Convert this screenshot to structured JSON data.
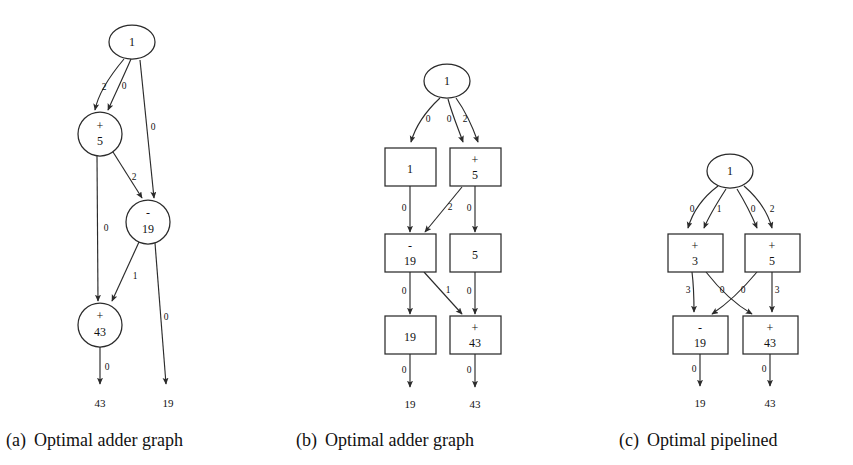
{
  "figure": {
    "background_color": "#ffffff",
    "stroke_color": "#2b2b2b",
    "text_color": "#111111"
  },
  "panels": [
    {
      "id": "a",
      "caption_tag": "(a)",
      "caption_text": "Optimal adder graph",
      "node_shape": "circle",
      "nodes": [
        {
          "key": "input",
          "op": "",
          "value": "1",
          "shape": "ellipse"
        },
        {
          "key": "add5",
          "op": "+",
          "value": "5",
          "shape": "circle"
        },
        {
          "key": "sub19",
          "op": "-",
          "value": "19",
          "shape": "circle"
        },
        {
          "key": "add43",
          "op": "+",
          "value": "43",
          "shape": "circle"
        }
      ],
      "edges": [
        {
          "from": "input",
          "to": "add5",
          "label": "2"
        },
        {
          "from": "input",
          "to": "add5",
          "label": "0"
        },
        {
          "from": "input",
          "to": "sub19",
          "label": "0"
        },
        {
          "from": "add5",
          "to": "add43",
          "label": "0"
        },
        {
          "from": "add5",
          "to": "sub19",
          "label": "2"
        },
        {
          "from": "sub19",
          "to": "add43",
          "label": "1"
        },
        {
          "from": "sub19",
          "to": "out19",
          "label": "0"
        },
        {
          "from": "add43",
          "to": "out43",
          "label": "0"
        }
      ],
      "terminals": [
        {
          "key": "out43",
          "value": "43"
        },
        {
          "key": "out19",
          "value": "19"
        }
      ]
    },
    {
      "id": "b",
      "caption_tag": "(b)",
      "caption_text": "Optimal adder graph",
      "node_shape": "rect",
      "nodes": [
        {
          "key": "input",
          "op": "",
          "value": "1",
          "shape": "ellipse"
        },
        {
          "key": "reg1",
          "op": "",
          "value": "1",
          "shape": "rect"
        },
        {
          "key": "add5",
          "op": "+",
          "value": "5",
          "shape": "rect"
        },
        {
          "key": "sub19",
          "op": "-",
          "value": "19",
          "shape": "rect"
        },
        {
          "key": "reg5",
          "op": "",
          "value": "5",
          "shape": "rect"
        },
        {
          "key": "reg19",
          "op": "",
          "value": "19",
          "shape": "rect"
        },
        {
          "key": "add43",
          "op": "+",
          "value": "43",
          "shape": "rect"
        }
      ],
      "edges": [
        {
          "from": "input",
          "to": "reg1",
          "label": "0"
        },
        {
          "from": "input",
          "to": "add5",
          "label": "0"
        },
        {
          "from": "input",
          "to": "add5",
          "label": "2"
        },
        {
          "from": "reg1",
          "to": "sub19",
          "label": "0"
        },
        {
          "from": "add5",
          "to": "sub19",
          "label": "2"
        },
        {
          "from": "add5",
          "to": "reg5",
          "label": "0"
        },
        {
          "from": "sub19",
          "to": "reg19",
          "label": "0"
        },
        {
          "from": "sub19",
          "to": "add43",
          "label": "1"
        },
        {
          "from": "reg5",
          "to": "add43",
          "label": "0"
        },
        {
          "from": "reg19",
          "to": "out19",
          "label": "0"
        },
        {
          "from": "add43",
          "to": "out43",
          "label": "0"
        }
      ],
      "terminals": [
        {
          "key": "out19",
          "value": "19"
        },
        {
          "key": "out43",
          "value": "43"
        }
      ]
    },
    {
      "id": "c",
      "caption_tag": "(c)",
      "caption_text": "Optimal pipelined",
      "node_shape": "rect",
      "nodes": [
        {
          "key": "input",
          "op": "",
          "value": "1",
          "shape": "ellipse"
        },
        {
          "key": "add3",
          "op": "+",
          "value": "3",
          "shape": "rect"
        },
        {
          "key": "add5",
          "op": "+",
          "value": "5",
          "shape": "rect"
        },
        {
          "key": "sub19",
          "op": "-",
          "value": "19",
          "shape": "rect"
        },
        {
          "key": "add43",
          "op": "+",
          "value": "43",
          "shape": "rect"
        }
      ],
      "edges": [
        {
          "from": "input",
          "to": "add3",
          "label": "0"
        },
        {
          "from": "input",
          "to": "add3",
          "label": "1"
        },
        {
          "from": "input",
          "to": "add5",
          "label": "0"
        },
        {
          "from": "input",
          "to": "add5",
          "label": "2"
        },
        {
          "from": "add3",
          "to": "sub19",
          "label": "3"
        },
        {
          "from": "add3",
          "to": "add43",
          "label": "0"
        },
        {
          "from": "add5",
          "to": "sub19",
          "label": "0"
        },
        {
          "from": "add5",
          "to": "add43",
          "label": "3"
        },
        {
          "from": "sub19",
          "to": "out19",
          "label": "0"
        },
        {
          "from": "add43",
          "to": "out43",
          "label": "0"
        }
      ],
      "terminals": [
        {
          "key": "out19",
          "value": "19"
        },
        {
          "key": "out43",
          "value": "43"
        }
      ]
    }
  ],
  "labels": {
    "panel_a": {
      "node_input": "1",
      "node_add5_op": "+",
      "node_add5_val": "5",
      "node_sub19_op": "-",
      "node_sub19_val": "19",
      "node_add43_op": "+",
      "node_add43_val": "43",
      "e_in_add5_a": "2",
      "e_in_add5_b": "0",
      "e_in_sub19": "0",
      "e_add5_add43": "0",
      "e_add5_sub19": "2",
      "e_sub19_add43": "1",
      "e_sub19_out": "0",
      "e_add43_out": "0",
      "term_43": "43",
      "term_19": "19",
      "cap_tag": "(a)",
      "cap_text": "Optimal adder graph"
    },
    "panel_b": {
      "node_input": "1",
      "node_reg1": "1",
      "node_add5_op": "+",
      "node_add5_val": "5",
      "node_sub19_op": "-",
      "node_sub19_val": "19",
      "node_reg5": "5",
      "node_reg19": "19",
      "node_add43_op": "+",
      "node_add43_val": "43",
      "e_in_reg1": "0",
      "e_in_add5_a": "0",
      "e_in_add5_b": "2",
      "e_reg1_sub19": "0",
      "e_add5_sub19": "2",
      "e_add5_reg5": "0",
      "e_sub19_reg19": "0",
      "e_sub19_add43": "1",
      "e_reg5_add43": "0",
      "e_reg19_out": "0",
      "e_add43_out": "0",
      "term_19": "19",
      "term_43": "43",
      "cap_tag": "(b)",
      "cap_text": "Optimal adder graph"
    },
    "panel_c": {
      "node_input": "1",
      "node_add3_op": "+",
      "node_add3_val": "3",
      "node_add5_op": "+",
      "node_add5_val": "5",
      "node_sub19_op": "-",
      "node_sub19_val": "19",
      "node_add43_op": "+",
      "node_add43_val": "43",
      "e_in_add3_a": "0",
      "e_in_add3_b": "1",
      "e_in_add5_a": "0",
      "e_in_add5_b": "2",
      "e_add3_sub19": "3",
      "e_add3_add43": "0",
      "e_add5_sub19": "0",
      "e_add5_add43": "3",
      "e_sub19_out": "0",
      "e_add43_out": "0",
      "term_19": "19",
      "term_43": "43",
      "cap_tag": "(c)",
      "cap_text": "Optimal pipelined"
    }
  }
}
